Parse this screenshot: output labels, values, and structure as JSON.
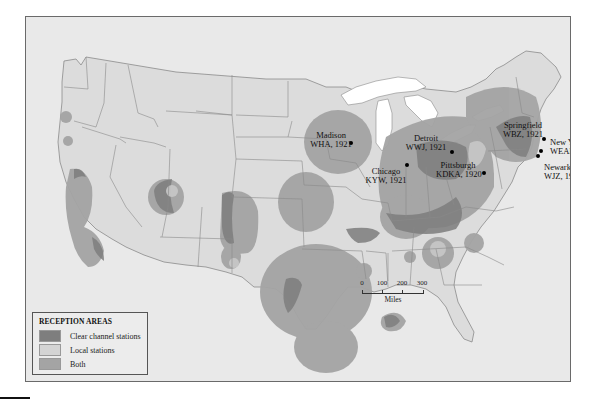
{
  "map": {
    "title_region": "United States",
    "colors": {
      "background": "#e9e9e9",
      "land": "#dcdcdc",
      "water_lakes": "#ffffff",
      "state_border": "#8a8a8a",
      "clear_channel": "#7e7e7e",
      "local": "#d4d4d4",
      "both": "#a4a4a4"
    },
    "stations": [
      {
        "city": "Madison",
        "call": "WHA, 1921",
        "x": 325,
        "y": 126,
        "label_x": 305,
        "label_y": 114,
        "align": "center"
      },
      {
        "city": "Detroit",
        "call": "WWJ, 1921",
        "x": 426,
        "y": 135,
        "label_x": 400,
        "label_y": 117,
        "align": "center"
      },
      {
        "city": "Chicago",
        "call": "KYW, 1921",
        "x": 381,
        "y": 148,
        "label_x": 360,
        "label_y": 150,
        "align": "center"
      },
      {
        "city": "Pittsburgh",
        "call": "KDKA, 1920",
        "x": 458,
        "y": 156,
        "label_x": 432,
        "label_y": 144,
        "align": "center"
      },
      {
        "city": "Springfield",
        "call": "WBZ, 1921",
        "x": 518,
        "y": 122,
        "label_x": 497,
        "label_y": 104,
        "align": "center"
      },
      {
        "city": "New York",
        "call": "WEAF, 1922",
        "x": 515,
        "y": 134,
        "label_x": 524,
        "label_y": 121,
        "align": "left"
      },
      {
        "city": "Newark",
        "call": "WJZ, 1921",
        "x": 512,
        "y": 139,
        "label_x": 518,
        "label_y": 146,
        "align": "left"
      }
    ]
  },
  "legend": {
    "title": "RECEPTION AREAS",
    "items": [
      {
        "label": "Clear channel stations",
        "color": "#7e7e7e"
      },
      {
        "label": "Local stations",
        "color": "#d4d4d4"
      },
      {
        "label": "Both",
        "color": "#a4a4a4"
      }
    ]
  },
  "scale": {
    "ticks": [
      "0",
      "100",
      "200",
      "300"
    ],
    "unit": "Miles"
  }
}
